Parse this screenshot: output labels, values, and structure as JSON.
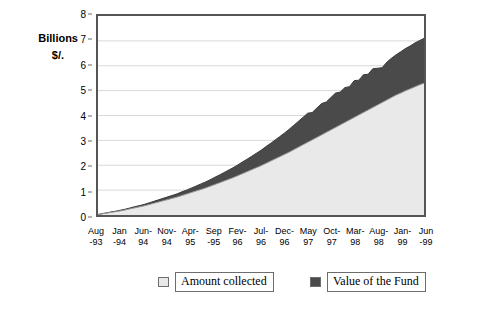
{
  "axis_caption": {
    "line1": "Billions",
    "line2": "$/."
  },
  "legend": {
    "amount": {
      "label": "Amount collected",
      "color": "#e9e9e9"
    },
    "fund": {
      "label": "Value of the Fund",
      "color": "#4a4a4a"
    }
  },
  "chart_data": {
    "type": "area",
    "stacked": true,
    "title": "",
    "subtitle": "",
    "xlabel": "",
    "ylabel": "Billions $/.",
    "ylim": [
      0,
      8
    ],
    "yticks": [
      0,
      1,
      2,
      3,
      4,
      5,
      6,
      7,
      8
    ],
    "ytick_labels": [
      "0",
      "1",
      "2",
      "3",
      "4",
      "5",
      "6",
      "7",
      "8"
    ],
    "grid": true,
    "grid_axis": "y",
    "legend_position": "bottom",
    "tick_labels": [
      "Aug -93",
      "Jan -94",
      "Jun- 94",
      "Nov- 94",
      "Apr- 95",
      "Sep -95",
      "Fev- 96",
      "Jul- 96",
      "Dec- 96",
      "May 97",
      "Oct- 97",
      "Mar- 98",
      "Aug- 98",
      "Jan- 99",
      "Jun -99"
    ],
    "tick_label_lines": [
      [
        "Aug",
        "-93"
      ],
      [
        "Jan",
        "-94"
      ],
      [
        "Jun-",
        "94"
      ],
      [
        "Nov-",
        "94"
      ],
      [
        "Apr-",
        "95"
      ],
      [
        "Sep",
        "-95"
      ],
      [
        "Fev-",
        "96"
      ],
      [
        "Jul-",
        "96"
      ],
      [
        "Dec-",
        "96"
      ],
      [
        "May",
        "97"
      ],
      [
        "Oct-",
        "97"
      ],
      [
        "Mar-",
        "98"
      ],
      [
        "Aug-",
        "98"
      ],
      [
        "Jan-",
        "99"
      ],
      [
        "Jun",
        "-99"
      ]
    ],
    "categories": [
      "Aug-93",
      "Sep-93",
      "Oct-93",
      "Nov-93",
      "Dec-93",
      "Jan-94",
      "Feb-94",
      "Mar-94",
      "Apr-94",
      "May-94",
      "Jun-94",
      "Jul-94",
      "Aug-94",
      "Sep-94",
      "Oct-94",
      "Nov-94",
      "Dec-94",
      "Jan-95",
      "Feb-95",
      "Mar-95",
      "Apr-95",
      "May-95",
      "Jun-95",
      "Jul-95",
      "Aug-95",
      "Sep-95",
      "Oct-95",
      "Nov-95",
      "Dec-95",
      "Jan-96",
      "Fev-96",
      "Mar-96",
      "Apr-96",
      "May-96",
      "Jun-96",
      "Jul-96",
      "Aug-96",
      "Sep-96",
      "Oct-96",
      "Nov-96",
      "Dec-96",
      "Jan-97",
      "Feb-97",
      "Mar-97",
      "Apr-97",
      "May-97",
      "Jun-97",
      "Jul-97",
      "Aug-97",
      "Sep-97",
      "Oct-97",
      "Nov-97",
      "Dec-97",
      "Jan-98",
      "Feb-98",
      "Mar-98",
      "Apr-98",
      "May-98",
      "Jun-98",
      "Jul-98",
      "Aug-98",
      "Sep-98",
      "Oct-98",
      "Nov-98",
      "Dec-98",
      "Jan-99",
      "Feb-99",
      "Mar-99",
      "Apr-99",
      "May-99",
      "Jun-99"
    ],
    "series": [
      {
        "name": "Amount collected",
        "color": "#e9e9e9",
        "values": [
          0.02,
          0.05,
          0.08,
          0.11,
          0.14,
          0.17,
          0.21,
          0.25,
          0.29,
          0.33,
          0.37,
          0.42,
          0.47,
          0.52,
          0.57,
          0.62,
          0.67,
          0.72,
          0.78,
          0.84,
          0.9,
          0.96,
          1.02,
          1.08,
          1.15,
          1.22,
          1.29,
          1.36,
          1.43,
          1.5,
          1.58,
          1.66,
          1.74,
          1.82,
          1.9,
          1.98,
          2.07,
          2.16,
          2.25,
          2.34,
          2.43,
          2.52,
          2.62,
          2.72,
          2.82,
          2.92,
          3.02,
          3.12,
          3.22,
          3.32,
          3.42,
          3.52,
          3.62,
          3.72,
          3.82,
          3.92,
          4.02,
          4.12,
          4.22,
          4.32,
          4.42,
          4.52,
          4.62,
          4.72,
          4.82,
          4.9,
          4.99,
          5.07,
          5.15,
          5.23,
          5.3
        ]
      },
      {
        "name": "Value of the Fund",
        "color": "#4a4a4a",
        "values": [
          0.0,
          0.01,
          0.01,
          0.02,
          0.02,
          0.03,
          0.03,
          0.04,
          0.05,
          0.05,
          0.06,
          0.07,
          0.08,
          0.09,
          0.1,
          0.11,
          0.12,
          0.13,
          0.15,
          0.16,
          0.18,
          0.2,
          0.22,
          0.24,
          0.26,
          0.29,
          0.31,
          0.34,
          0.37,
          0.4,
          0.43,
          0.47,
          0.5,
          0.54,
          0.58,
          0.62,
          0.67,
          0.71,
          0.76,
          0.81,
          0.86,
          0.92,
          0.98,
          1.04,
          1.1,
          1.17,
          1.1,
          1.18,
          1.26,
          1.22,
          1.3,
          1.38,
          1.32,
          1.4,
          1.34,
          1.48,
          1.4,
          1.52,
          1.44,
          1.56,
          1.48,
          1.4,
          1.52,
          1.58,
          1.62,
          1.66,
          1.7,
          1.72,
          1.76,
          1.78,
          1.8
        ]
      }
    ],
    "totals_note": {
      "final_amount_collected": 5.3,
      "final_total": 7.1
    }
  }
}
